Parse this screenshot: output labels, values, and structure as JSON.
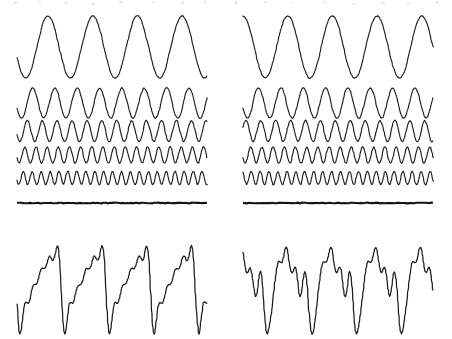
{
  "figure": {
    "background_color": "#ffffff",
    "stroke_color": "#1d1d1d",
    "divider_color": "#141414",
    "width": 452,
    "height": 339
  },
  "panels": [
    {
      "id": "left",
      "name": "in-phase-harmonics",
      "caption": "",
      "x_start": 17,
      "x_end": 207,
      "divider_y": 203,
      "components": [
        {
          "harmonic": 1,
          "cycles": 4.25,
          "amplitude": 31,
          "phase_deg": 200,
          "baseline_y": 47,
          "row": 1
        },
        {
          "harmonic": 2,
          "cycles": 8.5,
          "amplitude": 15,
          "phase_deg": 200,
          "baseline_y": 103,
          "row": 2
        },
        {
          "harmonic": 3,
          "cycles": 12.75,
          "amplitude": 10.5,
          "phase_deg": 200,
          "baseline_y": 131,
          "row": 3
        },
        {
          "harmonic": 4,
          "cycles": 17.0,
          "amplitude": 8,
          "phase_deg": 200,
          "baseline_y": 155,
          "row": 4
        },
        {
          "harmonic": 5,
          "cycles": 21.25,
          "amplitude": 6.5,
          "phase_deg": 200,
          "baseline_y": 178,
          "row": 5
        }
      ],
      "sum": {
        "name": "sawtooth-sum",
        "baseline_y": 282,
        "scale": 1.0,
        "shape": "sawtooth"
      }
    },
    {
      "id": "right",
      "name": "phase-shifted-harmonics",
      "caption": "",
      "x_start": 243,
      "x_end": 433,
      "divider_y": 203,
      "components": [
        {
          "harmonic": 1,
          "cycles": 4.25,
          "amplitude": 31,
          "phase_deg": 90,
          "baseline_y": 47,
          "row": 1
        },
        {
          "harmonic": 2,
          "cycles": 8.5,
          "amplitude": 15,
          "phase_deg": 200,
          "baseline_y": 103,
          "row": 2
        },
        {
          "harmonic": 3,
          "cycles": 12.75,
          "amplitude": 10.5,
          "phase_deg": 20,
          "baseline_y": 131,
          "row": 3
        },
        {
          "harmonic": 4,
          "cycles": 17.0,
          "amplitude": 8,
          "phase_deg": 200,
          "baseline_y": 155,
          "row": 4
        },
        {
          "harmonic": 5,
          "cycles": 21.25,
          "amplitude": 6.5,
          "phase_deg": 120,
          "baseline_y": 178,
          "row": 5
        }
      ],
      "sum": {
        "name": "phase-shifted-sum",
        "baseline_y": 282,
        "scale": 1.0,
        "shape": "irregular"
      }
    }
  ],
  "chart_data": {
    "type": "line",
    "xlabel": "",
    "ylabel": "",
    "grid": false,
    "legend": "none",
    "x": [
      0,
      1
    ],
    "xlim": [
      0,
      1
    ],
    "ylim": [
      -1,
      1
    ],
    "series": [
      {
        "name": "harmonic 1 (left)",
        "panel": "left",
        "frequency_multiple": 1,
        "relative_amplitude": 1.0,
        "phase_deg": 200,
        "cycles_shown": 4.25
      },
      {
        "name": "harmonic 2 (left)",
        "panel": "left",
        "frequency_multiple": 2,
        "relative_amplitude": 0.5,
        "phase_deg": 200,
        "cycles_shown": 8.5
      },
      {
        "name": "harmonic 3 (left)",
        "panel": "left",
        "frequency_multiple": 3,
        "relative_amplitude": 0.333,
        "phase_deg": 200,
        "cycles_shown": 12.75
      },
      {
        "name": "harmonic 4 (left)",
        "panel": "left",
        "frequency_multiple": 4,
        "relative_amplitude": 0.25,
        "phase_deg": 200,
        "cycles_shown": 17.0
      },
      {
        "name": "harmonic 5 (left)",
        "panel": "left",
        "frequency_multiple": 5,
        "relative_amplitude": 0.2,
        "phase_deg": 200,
        "cycles_shown": 21.25
      },
      {
        "name": "sum (left, sawtooth)",
        "panel": "left",
        "frequency_multiple": 1,
        "relative_amplitude": 1.0,
        "phase_deg": 200,
        "cycles_shown": 4.25
      },
      {
        "name": "harmonic 1 (right)",
        "panel": "right",
        "frequency_multiple": 1,
        "relative_amplitude": 1.0,
        "phase_deg": 90,
        "cycles_shown": 4.25
      },
      {
        "name": "harmonic 2 (right)",
        "panel": "right",
        "frequency_multiple": 2,
        "relative_amplitude": 0.5,
        "phase_deg": 200,
        "cycles_shown": 8.5
      },
      {
        "name": "harmonic 3 (right)",
        "panel": "right",
        "frequency_multiple": 3,
        "relative_amplitude": 0.333,
        "phase_deg": 20,
        "cycles_shown": 12.75
      },
      {
        "name": "harmonic 4 (right)",
        "panel": "right",
        "frequency_multiple": 4,
        "relative_amplitude": 0.25,
        "phase_deg": 200,
        "cycles_shown": 17.0
      },
      {
        "name": "harmonic 5 (right)",
        "panel": "right",
        "frequency_multiple": 5,
        "relative_amplitude": 0.2,
        "phase_deg": 120,
        "cycles_shown": 21.25
      },
      {
        "name": "sum (right, irregular)",
        "panel": "right",
        "frequency_multiple": 1,
        "relative_amplitude": 1.0,
        "phase_deg": 90,
        "cycles_shown": 4.25
      }
    ]
  }
}
